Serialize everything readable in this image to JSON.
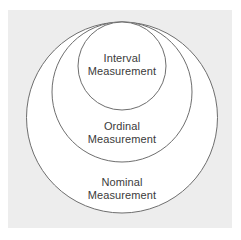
{
  "figure": {
    "name": "nested-circles-levels-of-measurement",
    "background_color": "#ffffff",
    "panel_color": "#ededed",
    "circle_fill": "#ffffff",
    "circle_stroke": "#6e6e6e",
    "text_color": "#3b3b3b"
  },
  "chart_data": {
    "type": "diagram",
    "subtype": "nested-circles",
    "title": "",
    "grid": false,
    "legend": null,
    "note": "Three circles nested inside one another, all internally tangent at the top of the outer circle.",
    "levels": [
      {
        "id": "nominal",
        "rank": 1,
        "label_line1": "Nominal",
        "label_line2": "Measurement",
        "label_full": "Nominal Measurement",
        "center_x": 122,
        "center_y": 117.5,
        "radius": 95.5,
        "diameter": 191
      },
      {
        "id": "ordinal",
        "rank": 2,
        "label_line1": "Ordinal",
        "label_line2": "Measurement",
        "label_full": "Ordinal Measurement",
        "center_x": 122,
        "center_y": 92,
        "radius": 70,
        "diameter": 140
      },
      {
        "id": "interval",
        "rank": 3,
        "label_line1": "Interval",
        "label_line2": "Measurement",
        "label_full": "Interval Measurement",
        "center_x": 122,
        "center_y": 66,
        "radius": 44,
        "diameter": 88
      }
    ]
  }
}
